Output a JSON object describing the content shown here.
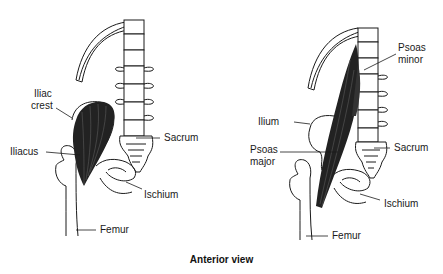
{
  "diagram": {
    "caption": "Anterior view",
    "left_figure": {
      "name": "iliacus-figure",
      "labels": {
        "iliac_crest_line1": "Iliac",
        "iliac_crest_line2": "crest",
        "iliacus": "Iliacus",
        "sacrum": "Sacrum",
        "ischium": "Ischium",
        "femur": "Femur"
      }
    },
    "right_figure": {
      "name": "psoas-figure",
      "labels": {
        "psoas_minor_line1": "Psoas",
        "psoas_minor_line2": "minor",
        "ilium": "Ilium",
        "psoas_major_line1": "Psoas",
        "psoas_major_line2": "major",
        "sacrum": "Sacrum",
        "ischium": "Ischium",
        "femur": "Femur"
      }
    },
    "colors": {
      "background": "#ffffff",
      "ink": "#1a1a1a",
      "muscle": "#222222"
    }
  }
}
